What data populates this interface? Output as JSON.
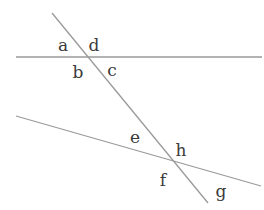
{
  "diagram": {
    "type": "parallel-lines-transversal-angles",
    "line_color": "#9a9a9a",
    "label_color": "#3a3a3a",
    "lines": [
      {
        "name": "upper-line",
        "x1": 16,
        "y1": 57,
        "x2": 262,
        "y2": 57
      },
      {
        "name": "lower-line",
        "x1": 16,
        "y1": 116,
        "x2": 261,
        "y2": 186
      },
      {
        "name": "transversal",
        "x1": 52,
        "y1": 13,
        "x2": 208,
        "y2": 203
      }
    ],
    "labels": [
      {
        "text": "a",
        "x": 63,
        "y": 45
      },
      {
        "text": "d",
        "x": 94,
        "y": 45
      },
      {
        "text": "b",
        "x": 78,
        "y": 72
      },
      {
        "text": "c",
        "x": 112,
        "y": 70
      },
      {
        "text": "e",
        "x": 135,
        "y": 137
      },
      {
        "text": "h",
        "x": 181,
        "y": 150
      },
      {
        "text": "f",
        "x": 163,
        "y": 180
      },
      {
        "text": "g",
        "x": 221,
        "y": 191
      }
    ]
  }
}
